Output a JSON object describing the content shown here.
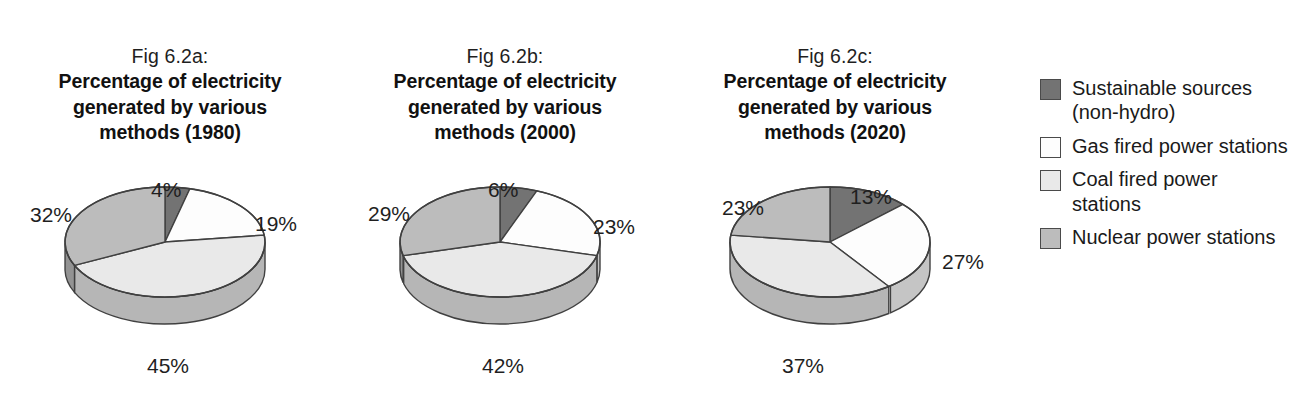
{
  "figure": {
    "background": "#ffffff",
    "series_colors": {
      "sustainable": "#737373",
      "gas": "#fdfdfd",
      "coal": "#e9e9e9",
      "nuclear": "#bcbcbc",
      "outline": "#404040",
      "rim_shade": "#8c8c8c"
    }
  },
  "charts": [
    {
      "fig_no": "Fig 6.2a:",
      "title": "Percentage of electricity generated by various methods (1980)",
      "year": "1980",
      "labels": {
        "top": "4%",
        "right": "19%",
        "bottom": "45%",
        "left": "32%"
      }
    },
    {
      "fig_no": "Fig 6.2b:",
      "title": "Percentage of electricity generated by various methods (2000)",
      "year": "2000",
      "labels": {
        "top": "6%",
        "right": "23%",
        "bottom": "42%",
        "left": "29%"
      }
    },
    {
      "fig_no": "Fig 6.2c:",
      "title": "Percentage of electricity generated by various methods (2020)",
      "year": "2020",
      "labels": {
        "top": "13%",
        "right": "27%",
        "bottom": "37%",
        "left": "23%"
      }
    }
  ],
  "legend": {
    "position": "right",
    "items": [
      {
        "label": "Sustainable sources (non-hydro)",
        "color": "#737373",
        "key": "sustainable"
      },
      {
        "label": "Gas fired power stations",
        "color": "#fdfdfd",
        "key": "gas"
      },
      {
        "label": "Coal fired power stations",
        "color": "#e9e9e9",
        "key": "coal"
      },
      {
        "label": "Nuclear power stations",
        "color": "#bcbcbc",
        "key": "nuclear"
      }
    ]
  },
  "chart_data": [
    {
      "type": "pie",
      "title": "Fig 6.2a: Percentage of electricity generated by various methods (1980)",
      "labels": [
        "Sustainable sources (non-hydro)",
        "Gas fired power stations",
        "Coal fired power stations",
        "Nuclear power stations"
      ],
      "values": [
        4,
        19,
        45,
        32
      ],
      "unit": "%",
      "colors": [
        "#737373",
        "#fdfdfd",
        "#e9e9e9",
        "#bcbcbc"
      ],
      "start_angle_deg": 0,
      "direction": "clockwise",
      "three_d": true,
      "legend_position": "right",
      "grid": false
    },
    {
      "type": "pie",
      "title": "Fig 6.2b: Percentage of electricity generated by various methods (2000)",
      "labels": [
        "Sustainable sources (non-hydro)",
        "Gas fired power stations",
        "Coal fired power stations",
        "Nuclear power stations"
      ],
      "values": [
        6,
        23,
        42,
        29
      ],
      "unit": "%",
      "colors": [
        "#737373",
        "#fdfdfd",
        "#e9e9e9",
        "#bcbcbc"
      ],
      "start_angle_deg": 0,
      "direction": "clockwise",
      "three_d": true,
      "legend_position": "right",
      "grid": false
    },
    {
      "type": "pie",
      "title": "Fig 6.2c: Percentage of electricity generated by various methods (2020)",
      "labels": [
        "Sustainable sources (non-hydro)",
        "Gas fired power stations",
        "Coal fired power stations",
        "Nuclear power stations"
      ],
      "values": [
        13,
        27,
        37,
        23
      ],
      "unit": "%",
      "colors": [
        "#737373",
        "#fdfdfd",
        "#e9e9e9",
        "#bcbcbc"
      ],
      "start_angle_deg": 0,
      "direction": "clockwise",
      "three_d": true,
      "legend_position": "right",
      "grid": false
    }
  ]
}
